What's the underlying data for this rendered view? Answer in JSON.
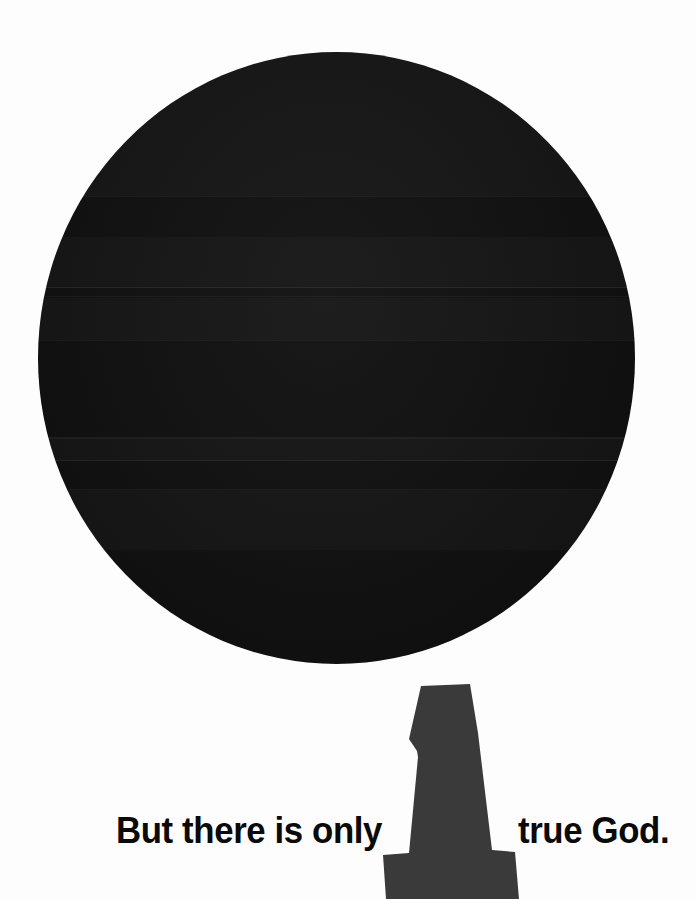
{
  "poster": {
    "background_color": "#fdfdfd",
    "width": 696,
    "height": 899,
    "full_message": "But there is only 1 true God."
  },
  "circle": {
    "name": "large-dark-circle",
    "fill_color": "#141414",
    "center_x": 336,
    "center_y": 358,
    "diameter": 597,
    "description": "solid near-black filled circle"
  },
  "numeral": {
    "glyph": "1",
    "fill_color": "#3a3a3a",
    "description": "oversized bold numeral one acting as the word 'one' in the sentence"
  },
  "caption": {
    "left_text": "But there is only",
    "right_text": "true God.",
    "color": "#0a0a0a"
  },
  "scan_artifacts": {
    "note": "faint horizontal scanner banding across the circle",
    "line_positions_y": [
      196,
      287,
      296,
      437,
      460,
      489
    ]
  }
}
